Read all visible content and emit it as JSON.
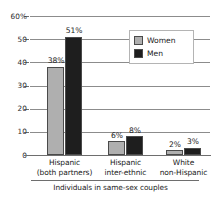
{
  "chart_data": {
    "type": "bar",
    "title": "",
    "subtitle": "",
    "xlabel": "Individuals in same-sex couples",
    "ylabel": "",
    "ylim": [
      0,
      60
    ],
    "yticks": [
      0,
      10,
      20,
      30,
      40,
      50,
      60
    ],
    "ytick_labels": [
      "0",
      "10",
      "20",
      "30",
      "40",
      "50",
      "60%"
    ],
    "grid": true,
    "legend_position": "upper right",
    "categories": [
      "Hispanic (both partners)",
      "Hispanic inter-ethnic",
      "White non-Hispanic"
    ],
    "category_lines": [
      {
        "line1": "Hispanic",
        "line2": "(both partners)"
      },
      {
        "line1": "Hispanic",
        "line2": "inter-ethnic"
      },
      {
        "line1": "White",
        "line2": "non-Hispanic"
      }
    ],
    "series": [
      {
        "name": "Women",
        "color": "#afafaf",
        "values": [
          38,
          6,
          2
        ],
        "data_labels": [
          "38%",
          "6%",
          "2%"
        ]
      },
      {
        "name": "Men",
        "color": "#1e1e1e",
        "values": [
          51,
          8,
          3
        ],
        "data_labels": [
          "51%",
          "8%",
          "3%"
        ]
      }
    ]
  },
  "legend": {
    "items": [
      {
        "label": "Women",
        "color": "#afafaf"
      },
      {
        "label": "Men",
        "color": "#1e1e1e"
      }
    ]
  },
  "colors": {
    "women": "#afafaf",
    "men": "#1e1e1e",
    "gridline": "#8c8c8c",
    "axis": "#6e6e6e",
    "text": "#1a1a1a",
    "background": "#ffffff"
  }
}
